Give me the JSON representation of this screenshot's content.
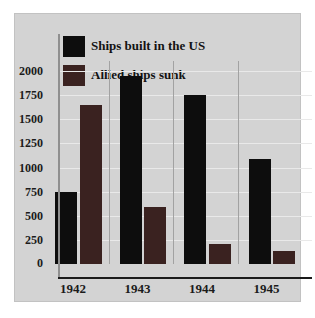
{
  "chart_data": {
    "type": "bar",
    "title": "",
    "categories": [
      "1942",
      "1943",
      "1944",
      "1945"
    ],
    "series": [
      {
        "name": "Ships built in the US",
        "color": "#0d0d0d",
        "values": [
          750,
          1950,
          1750,
          1090
        ]
      },
      {
        "name": "Allied ships sunk",
        "color": "#3a2220",
        "values": [
          1650,
          590,
          210,
          130
        ]
      }
    ],
    "ylim": [
      0,
      2000
    ],
    "yticks": [
      0,
      250,
      500,
      750,
      1000,
      1250,
      1500,
      1750,
      2000
    ],
    "grid": "horizontal",
    "legend_position": "top-left"
  },
  "colors": {
    "panel_background": "#d3d3d3",
    "gridline": "#e9e9e9",
    "group_separator": "#a2a2a2",
    "axis": "#1a1a1a",
    "text": "#1b1b1b"
  }
}
